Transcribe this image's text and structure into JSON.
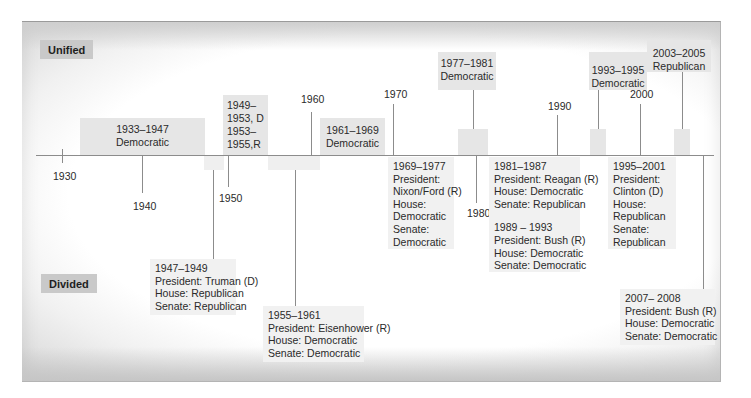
{
  "labels": {
    "unified": "Unified",
    "divided": "Divided"
  },
  "axis": {
    "years": [
      "1930",
      "1940",
      "1950",
      "1960",
      "1970",
      "1980",
      "1990",
      "2000"
    ]
  },
  "unified_periods": [
    {
      "lines": [
        "1933–1947",
        "Democratic"
      ]
    },
    {
      "lines": [
        "1949–",
        "1953, D",
        "1953–",
        "1955,R"
      ]
    },
    {
      "lines": [
        "1961–1969",
        "Democratic"
      ]
    },
    {
      "lines": [
        "1977–1981",
        "Democratic"
      ]
    },
    {
      "lines": [
        "1993–1995",
        "Democratic"
      ]
    },
    {
      "lines": [
        "2003–2005",
        "Republican"
      ]
    }
  ],
  "divided_periods": [
    {
      "lines": [
        "1947–1949",
        "President: Truman (D)",
        "House: Republican",
        "Senate: Republican"
      ]
    },
    {
      "lines": [
        "1955–1961",
        "President: Eisenhower (R)",
        "House: Democratic",
        "Senate: Democratic"
      ]
    },
    {
      "lines": [
        "1969–1977",
        "President:",
        "Nixon/Ford (R)",
        "House:",
        "Democratic",
        "Senate:",
        "Democratic"
      ]
    },
    {
      "lines": [
        "1981–1987",
        "President: Reagan (R)",
        "House: Democratic",
        "Senate: Republican"
      ]
    },
    {
      "lines": [
        "1989 – 1993",
        "President: Bush (R)",
        "House: Democratic",
        "Senate: Democratic"
      ]
    },
    {
      "lines": [
        "1995–2001",
        "President:",
        "Clinton (D)",
        "House:",
        "Republican",
        "Senate:",
        "Republican"
      ]
    },
    {
      "lines": [
        "2007– 2008",
        "President: Bush (R)",
        "House: Democratic",
        "Senate: Democratic"
      ]
    }
  ],
  "colors": {
    "unified_box": "#e6e6e6",
    "divided_box": "#f1f1f1",
    "label_tag": "#c9c9c9",
    "axis_line": "#8c8c8c"
  }
}
